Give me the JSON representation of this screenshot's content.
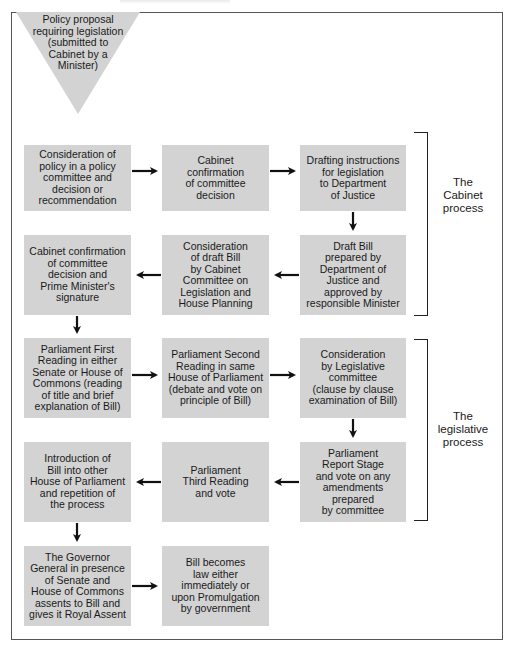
{
  "diagram": {
    "title_fragment": "",
    "start": {
      "shape": "inverted-triangle",
      "text": "Policy proposal\nrequiring legislation\n(submitted to\nCabinet by a\nMinister)"
    },
    "steps": [
      {
        "id": "s1",
        "text": "Consideration of\npolicy in a policy\ncommittee and\ndecision or\nrecommendation"
      },
      {
        "id": "s2",
        "text": "Cabinet\nconfirmation\nof committee\ndecision"
      },
      {
        "id": "s3",
        "text": "Drafting instructions\nfor legislation\nto Department\nof Justice"
      },
      {
        "id": "s4",
        "text": "Draft Bill\nprepared by\nDepartment of\nJustice and\napproved by\nresponsible Minister"
      },
      {
        "id": "s5",
        "text": "Consideration\nof draft Bill\nby Cabinet\nCommittee on\nLegislation and\nHouse Planning"
      },
      {
        "id": "s6",
        "text": "Cabinet confirmation\nof committee\ndecision and\nPrime Minister's\nsignature"
      },
      {
        "id": "s7",
        "text": "Parliament First\nReading in either\nSenate or House of\nCommons (reading\nof title and brief\nexplanation of Bill)"
      },
      {
        "id": "s8",
        "text": "Parliament Second\nReading in same\nHouse of Parliament\n(debate and vote on\nprinciple of Bill)"
      },
      {
        "id": "s9",
        "text": "Consideration\nby Legislative\ncommittee\n(clause by clause\nexamination of Bill)"
      },
      {
        "id": "s10",
        "text": "Parliament\nReport Stage\nand vote on any\namendments\nprepared\nby committee"
      },
      {
        "id": "s11",
        "text": "Parliament\nThird Reading\nand vote"
      },
      {
        "id": "s12",
        "text": "Introduction of\nBill into other\nHouse of Parliament\nand repetition of\nthe process"
      },
      {
        "id": "s13",
        "text": "The Governor\nGeneral in presence\nof Senate and\nHouse of Commons\nassents to Bill and\ngives it Royal Assent"
      },
      {
        "id": "s14",
        "text": "Bill becomes\nlaw either\nimmediately or\nupon Promulgation\nby government"
      }
    ],
    "flow": [
      [
        "start",
        "s1"
      ],
      [
        "s1",
        "s2"
      ],
      [
        "s2",
        "s3"
      ],
      [
        "s3",
        "s4"
      ],
      [
        "s4",
        "s5"
      ],
      [
        "s5",
        "s6"
      ],
      [
        "s6",
        "s7"
      ],
      [
        "s7",
        "s8"
      ],
      [
        "s8",
        "s9"
      ],
      [
        "s9",
        "s10"
      ],
      [
        "s10",
        "s11"
      ],
      [
        "s11",
        "s12"
      ],
      [
        "s12",
        "s13"
      ],
      [
        "s13",
        "s14"
      ]
    ],
    "groups": [
      {
        "label": "The\nCabinet\nprocess",
        "covers": [
          "s3",
          "s4"
        ]
      },
      {
        "label": "The\nlegislative\nprocess",
        "covers": [
          "s9",
          "s10"
        ]
      }
    ],
    "colors": {
      "box_fill": "#d3d3d3",
      "arrow": "#111111",
      "frame": "#555555"
    }
  }
}
